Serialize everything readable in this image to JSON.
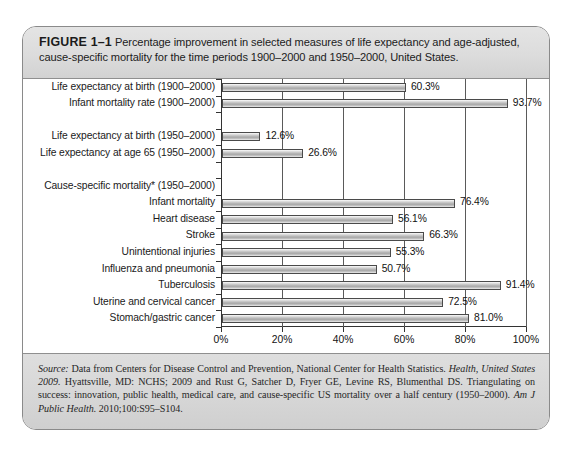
{
  "figure": {
    "label": "FIGURE 1–1",
    "caption_line1": "Percentage improvement in selected measures of life expectancy and age-adjusted,",
    "caption_line2": "cause-specific mortality for the time periods 1900–2000 and 1950–2000, United States."
  },
  "footnote": "*Age-adjusted.",
  "source": {
    "label": "Source:",
    "part1": " Data from Centers for Disease Control and Prevention, National Center for Health Statistics. ",
    "italic1": "Health, United States 2009.",
    "part2": " Hyattsville, MD: NCHS; 2009 and Rust G, Satcher D, Fryer GE, Levine RS, Blumenthal DS. Triangulating on success: innovation, public health, medical care, and cause-specific US mortality over a half century (1950–2000). ",
    "italic2": "Am J Public Health.",
    "part3": " 2010;100:S95–S104."
  },
  "chart_data": {
    "type": "bar",
    "orientation": "horizontal",
    "xlabel": "Percentage improvement",
    "ylabel": "",
    "xlim": [
      0,
      100
    ],
    "xticks": [
      0,
      20,
      40,
      60,
      80,
      100
    ],
    "xtick_labels": [
      "0%",
      "20%",
      "40%",
      "60%",
      "80%",
      "100%"
    ],
    "grid": true,
    "grid_axis": "x",
    "legend": false,
    "categories": [
      "Life expectancy at birth (1900–2000)",
      "Infant mortality rate (1900–2000)",
      "",
      "Life expectancy at birth (1950–2000)",
      "Life expectancy at age 65 (1950–2000)",
      "",
      "Cause-specific mortality* (1950–2000)",
      "Infant mortality",
      "Heart disease",
      "Stroke",
      "Unintentional injuries",
      "Influenza and pneumonia",
      "Tuberculosis",
      "Uterine and cervical cancer",
      "Stomach/gastric cancer"
    ],
    "values": [
      60.3,
      93.7,
      null,
      12.6,
      26.6,
      null,
      null,
      76.4,
      56.1,
      66.3,
      55.3,
      50.7,
      91.4,
      72.5,
      81.0
    ],
    "value_labels": [
      "60.3%",
      "93.7%",
      "",
      "12.6%",
      "26.6%",
      "",
      "",
      "76.4%",
      "56.1%",
      "66.3%",
      "55.3%",
      "50.7%",
      "91.4%",
      "72.5%",
      "81.0%"
    ],
    "bar_color": "#b9b9b9",
    "bar_edge_color": "#4a4a4a"
  }
}
